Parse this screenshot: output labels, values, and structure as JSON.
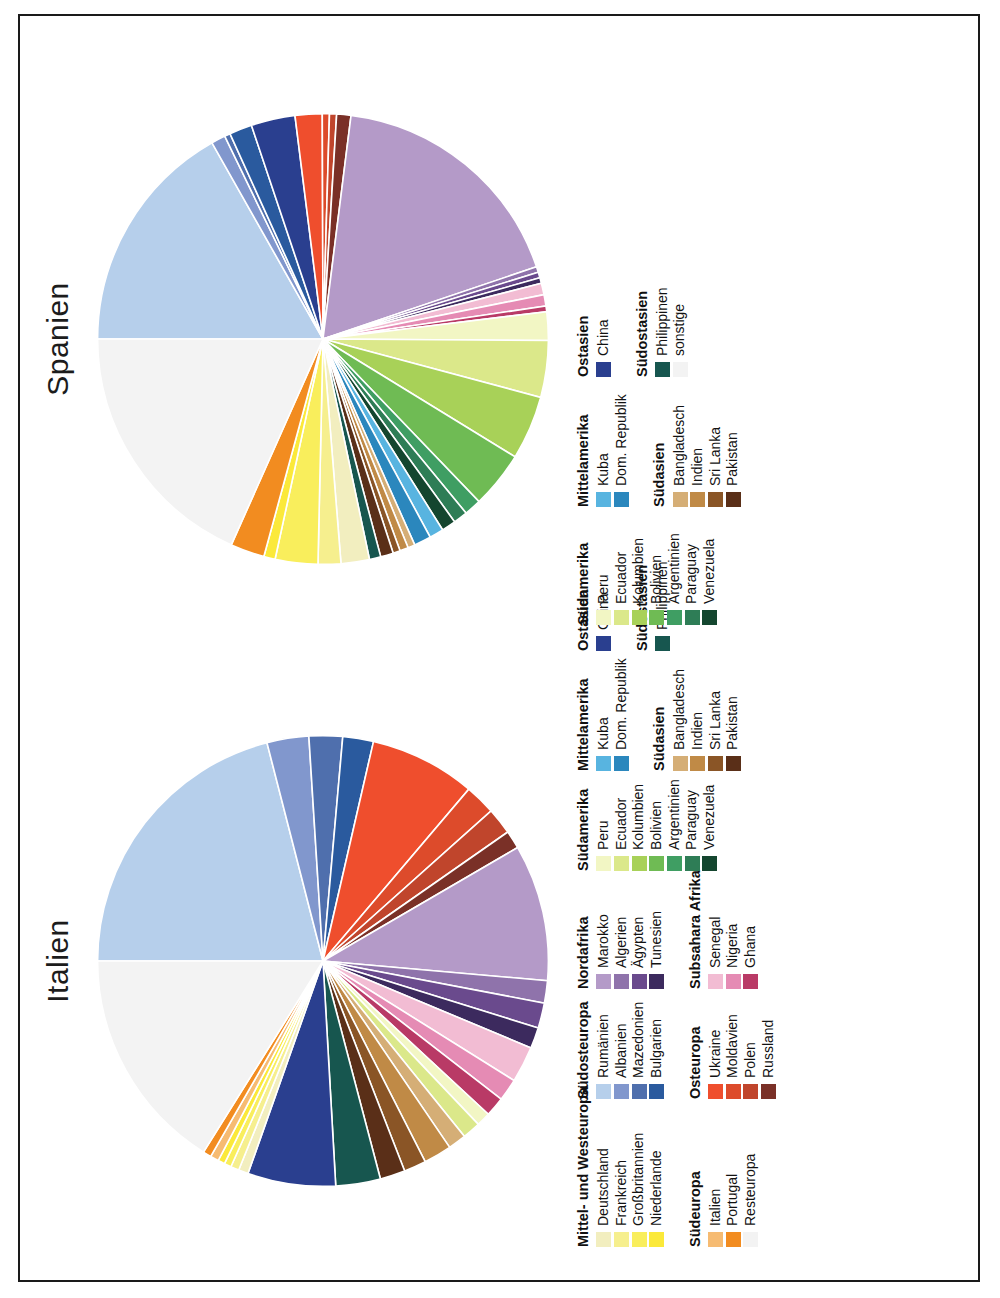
{
  "figure": {
    "orientation": "rotated-90-ccw",
    "background": "#ffffff",
    "border_color": "#1a1a1a"
  },
  "chart_data": [
    {
      "type": "pie",
      "title": "Italien",
      "xlabel": "",
      "ylabel": "",
      "legend_position": "below",
      "categories": [
        "Rumänien",
        "Albanien",
        "Mazedonien",
        "Bulgarien",
        "Ukraine",
        "Moldavien",
        "Polen",
        "Russland",
        "Marokko",
        "Algerien",
        "Ägypten",
        "Tunesien",
        "Senegal",
        "Nigeria",
        "Ghana",
        "Peru",
        "Ecuador",
        "Bangladesch",
        "Indien",
        "Sri Lanka",
        "Pakistan",
        "Philippinen",
        "China",
        "Deutschland",
        "Frankreich",
        "Großbritannien",
        "Niederlande",
        "Italien",
        "Portugal",
        "Resteuropa"
      ],
      "values": [
        21.0,
        3.0,
        2.4,
        2.2,
        7.6,
        2.2,
        1.9,
        1.3,
        9.8,
        1.6,
        1.8,
        1.5,
        2.6,
        1.6,
        1.4,
        1.0,
        1.3,
        1.3,
        2.0,
        1.6,
        1.8,
        3.2,
        6.3,
        0.7,
        0.6,
        0.5,
        0.5,
        0.6,
        0.6,
        16.1
      ]
    },
    {
      "type": "pie",
      "title": "Spanien",
      "xlabel": "",
      "ylabel": "",
      "legend_position": "below",
      "categories": [
        "Rumänien",
        "Albanien",
        "Mazedonien",
        "Bulgarien",
        "China",
        "Ukraine",
        "Moldavien",
        "Polen",
        "Russland",
        "Marokko",
        "Algerien",
        "Ägypten",
        "Tunesien",
        "Senegal",
        "Nigeria",
        "Ghana",
        "Peru",
        "Ecuador",
        "Kolumbien",
        "Bolivien",
        "Argentinien",
        "Paraguay",
        "Venezuela",
        "Kuba",
        "Dom. Republik",
        "Bangladesch",
        "Indien",
        "Sri Lanka",
        "Pakistan",
        "Philippinen",
        "Deutschland",
        "Frankreich",
        "Großbritannien",
        "Niederlande",
        "Portugal",
        "sonstige"
      ],
      "values": [
        16.5,
        1.0,
        0.4,
        1.6,
        3.1,
        1.9,
        0.5,
        0.5,
        1.0,
        17.5,
        0.4,
        0.4,
        0.4,
        0.8,
        0.8,
        0.4,
        2.0,
        4.0,
        4.5,
        4.0,
        1.2,
        1.0,
        1.0,
        1.0,
        1.2,
        0.5,
        0.6,
        0.5,
        0.9,
        0.8,
        2.0,
        1.6,
        3.0,
        0.8,
        2.4,
        18.0
      ]
    }
  ],
  "panels": [
    {
      "name": "italien",
      "title": "Italien",
      "legend_columns": [
        {
          "blocks": [
            {
              "title": "Mittel- und Westeuropa",
              "items": [
                {
                  "label": "Deutschland",
                  "color": "#f2eebf"
                },
                {
                  "label": "Frankreich",
                  "color": "#f6ef8e"
                },
                {
                  "label": "Großbritannien",
                  "color": "#f9ee5c"
                },
                {
                  "label": "Niederlande",
                  "color": "#fbe93a"
                }
              ]
            },
            {
              "title": "Südeuropa",
              "items": [
                {
                  "label": "Italien",
                  "color": "#f6bb72"
                },
                {
                  "label": "Portugal",
                  "color": "#f28c20"
                },
                {
                  "label": "Resteuropa",
                  "color": "#f3f3f3"
                }
              ]
            }
          ]
        },
        {
          "blocks": [
            {
              "title": "Südosteuropa",
              "items": [
                {
                  "label": "Rumänien",
                  "color": "#b6cfeb"
                },
                {
                  "label": "Albanien",
                  "color": "#8197cd"
                },
                {
                  "label": "Mazedonien",
                  "color": "#4f6fad"
                },
                {
                  "label": "Bulgarien",
                  "color": "#2a5a9e"
                }
              ]
            },
            {
              "title": "Osteuropa",
              "items": [
                {
                  "label": "Ukraine",
                  "color": "#ef4e2d"
                },
                {
                  "label": "Moldavien",
                  "color": "#dd4b2b"
                },
                {
                  "label": "Polen",
                  "color": "#c0452c"
                },
                {
                  "label": "Russland",
                  "color": "#7a3027"
                }
              ]
            }
          ]
        },
        {
          "blocks": [
            {
              "title": "Nordafrika",
              "items": [
                {
                  "label": "Marokko",
                  "color": "#b49ac8"
                },
                {
                  "label": "Algerien",
                  "color": "#8f73ab"
                },
                {
                  "label": "Ägypten",
                  "color": "#6a4a8d"
                },
                {
                  "label": "Tunesien",
                  "color": "#3c2a5e"
                }
              ]
            },
            {
              "title": "Subsahara Afrika",
              "items": [
                {
                  "label": "Senegal",
                  "color": "#f2bcd3"
                },
                {
                  "label": "Nigeria",
                  "color": "#e58bb4"
                },
                {
                  "label": "Ghana",
                  "color": "#b93a66"
                }
              ]
            }
          ]
        },
        {
          "blocks": [
            {
              "title": "Südamerika",
              "items": [
                {
                  "label": "Peru",
                  "color": "#f2f6c4"
                },
                {
                  "label": "Ecuador",
                  "color": "#dbe88a"
                },
                {
                  "label": "Kolumbien",
                  "color": "#a8d158"
                },
                {
                  "label": "Bolivien",
                  "color": "#6fbb54"
                },
                {
                  "label": "Argentinien",
                  "color": "#3f9e63"
                },
                {
                  "label": "Paraguay",
                  "color": "#2e7d56"
                },
                {
                  "label": "Venezuela",
                  "color": "#14462f"
                }
              ]
            }
          ]
        },
        {
          "blocks": [
            {
              "title": "Mittelamerika",
              "items": [
                {
                  "label": "Kuba",
                  "color": "#58b4e0"
                },
                {
                  "label": "Dom. Republik",
                  "color": "#2b87bd"
                }
              ]
            },
            {
              "title": "Südasien",
              "items": [
                {
                  "label": "Bangladesch",
                  "color": "#d5ae76"
                },
                {
                  "label": "Indien",
                  "color": "#c08a46"
                },
                {
                  "label": "Sri Lanka",
                  "color": "#8a5526"
                },
                {
                  "label": "Pakistan",
                  "color": "#5a2f18"
                }
              ]
            }
          ]
        },
        {
          "blocks": [
            {
              "title": "Ostasien",
              "items": [
                {
                  "label": "China",
                  "color": "#2a3f8f"
                }
              ]
            },
            {
              "title": "Südostasien",
              "items": [
                {
                  "label": "Philippinen",
                  "color": "#17564f"
                }
              ]
            }
          ]
        }
      ]
    },
    {
      "name": "spanien",
      "title": "Spanien",
      "legend_columns": [
        {
          "blocks": [
            {
              "title": "Südamerika",
              "items": [
                {
                  "label": "Peru",
                  "color": "#f2f6c4"
                },
                {
                  "label": "Ecuador",
                  "color": "#dbe88a"
                },
                {
                  "label": "Kolumbien",
                  "color": "#a8d158"
                },
                {
                  "label": "Bolivien",
                  "color": "#6fbb54"
                },
                {
                  "label": "Argentinien",
                  "color": "#3f9e63"
                },
                {
                  "label": "Paraguay",
                  "color": "#2e7d56"
                },
                {
                  "label": "Venezuela",
                  "color": "#14462f"
                }
              ]
            }
          ]
        },
        {
          "blocks": [
            {
              "title": "Mittelamerika",
              "items": [
                {
                  "label": "Kuba",
                  "color": "#58b4e0"
                },
                {
                  "label": "Dom. Republik",
                  "color": "#2b87bd"
                }
              ]
            },
            {
              "title": "Südasien",
              "items": [
                {
                  "label": "Bangladesch",
                  "color": "#d5ae76"
                },
                {
                  "label": "Indien",
                  "color": "#c08a46"
                },
                {
                  "label": "Sri Lanka",
                  "color": "#8a5526"
                },
                {
                  "label": "Pakistan",
                  "color": "#5a2f18"
                }
              ]
            }
          ]
        },
        {
          "blocks": [
            {
              "title": "Ostasien",
              "items": [
                {
                  "label": "China",
                  "color": "#2a3f8f"
                }
              ]
            },
            {
              "title": "Südostasien",
              "items": [
                {
                  "label": "Philippinen",
                  "color": "#17564f"
                },
                {
                  "label": "sonstige",
                  "color": "#f3f3f3"
                }
              ]
            }
          ]
        }
      ]
    }
  ]
}
